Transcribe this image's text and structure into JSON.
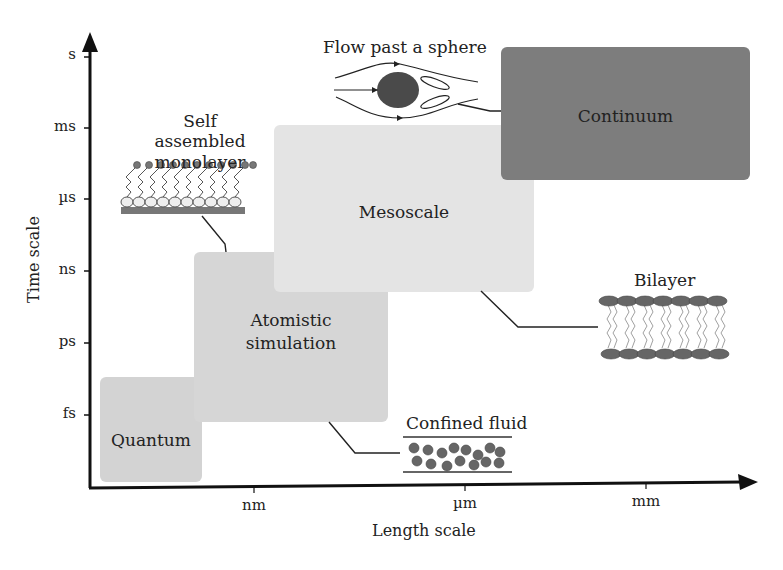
{
  "diagram": {
    "axes": {
      "y_label": "Time scale",
      "x_label": "Length scale",
      "y_ticks": [
        "s",
        "ms",
        "µs",
        "ns",
        "ps",
        "fs"
      ],
      "x_ticks": [
        "nm",
        "µm",
        "mm"
      ]
    },
    "regions": [
      {
        "id": "quantum",
        "label": "Quantum",
        "color": "#d3d3d3"
      },
      {
        "id": "atomistic",
        "label_line1": "Atomistic",
        "label_line2": "simulation",
        "color": "#d6d6d6"
      },
      {
        "id": "mesoscale",
        "label": "Mesoscale",
        "color": "#e4e4e4"
      },
      {
        "id": "continuum",
        "label": "Continuum",
        "color": "#7d7d7d"
      }
    ],
    "examples": {
      "sam_line1": "Self assembled",
      "sam_line2": "monolayer",
      "flow": "Flow past a sphere",
      "bilayer": "Bilayer",
      "confined": "Confined fluid"
    }
  }
}
